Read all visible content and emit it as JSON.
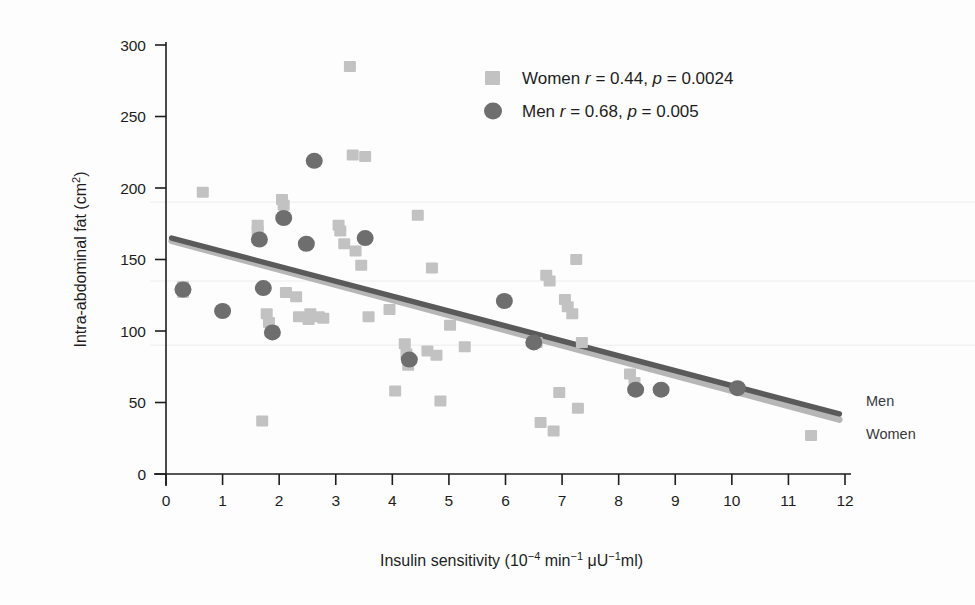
{
  "chart_data": {
    "type": "scatter",
    "title": "",
    "xlabel": "Insulin sensitivity (10−4 min−1 μU−1ml)",
    "ylabel": "Intra-abdominal fat (cm2)",
    "xlim": [
      0,
      12
    ],
    "ylim": [
      0,
      300
    ],
    "xticks": [
      "0",
      "1",
      "2",
      "3",
      "4",
      "5",
      "6",
      "7",
      "8",
      "9",
      "10",
      "11",
      "12"
    ],
    "xtick_values": [
      0,
      1,
      2,
      3,
      4,
      5,
      6,
      7,
      8,
      9,
      10,
      11,
      12
    ],
    "yticks": [
      "0",
      "50",
      "100",
      "150",
      "200",
      "250",
      "300"
    ],
    "ytick_values": [
      0,
      50,
      100,
      150,
      200,
      250,
      300
    ],
    "grid": "faint horizontal only",
    "legend_position": "top-right inside",
    "series": [
      {
        "name": "Women",
        "marker": "square",
        "color": "#c2c2c2",
        "r": 0.44,
        "p": 0.0024,
        "legend_label": "Women r = 0.44, p = 0.0024",
        "line_label": "Women",
        "points": [
          [
            0.3,
            131
          ],
          [
            0.3,
            127
          ],
          [
            0.65,
            197
          ],
          [
            1.62,
            174
          ],
          [
            1.62,
            170
          ],
          [
            1.7,
            37
          ],
          [
            1.78,
            112
          ],
          [
            1.82,
            106
          ],
          [
            1.88,
            100
          ],
          [
            2.05,
            192
          ],
          [
            2.08,
            188
          ],
          [
            2.12,
            127
          ],
          [
            2.3,
            124
          ],
          [
            2.35,
            110
          ],
          [
            2.52,
            108
          ],
          [
            2.55,
            112
          ],
          [
            2.7,
            110
          ],
          [
            2.78,
            109
          ],
          [
            3.05,
            174
          ],
          [
            3.08,
            170
          ],
          [
            3.15,
            161
          ],
          [
            3.25,
            285
          ],
          [
            3.3,
            223
          ],
          [
            3.35,
            156
          ],
          [
            3.45,
            146
          ],
          [
            3.52,
            222
          ],
          [
            3.58,
            110
          ],
          [
            3.95,
            115
          ],
          [
            4.05,
            58
          ],
          [
            4.22,
            91
          ],
          [
            4.25,
            84
          ],
          [
            4.28,
            76
          ],
          [
            4.45,
            181
          ],
          [
            4.62,
            86
          ],
          [
            4.7,
            144
          ],
          [
            4.78,
            83
          ],
          [
            4.85,
            51
          ],
          [
            5.02,
            104
          ],
          [
            5.28,
            89
          ],
          [
            6.55,
            92
          ],
          [
            6.62,
            36
          ],
          [
            6.72,
            139
          ],
          [
            6.78,
            135
          ],
          [
            6.85,
            30
          ],
          [
            6.95,
            57
          ],
          [
            7.05,
            122
          ],
          [
            7.1,
            117
          ],
          [
            7.18,
            112
          ],
          [
            7.25,
            150
          ],
          [
            7.28,
            46
          ],
          [
            7.35,
            92
          ],
          [
            8.2,
            70
          ],
          [
            8.28,
            64
          ],
          [
            11.4,
            27
          ]
        ],
        "trend_line": {
          "x1": 0.1,
          "y1": 163,
          "x2": 11.9,
          "y2": 38
        }
      },
      {
        "name": "Men",
        "marker": "circle",
        "color": "#6e6e6e",
        "r": 0.68,
        "p": 0.005,
        "legend_label": "Men r = 0.68, p = 0.005",
        "line_label": "Men",
        "points": [
          [
            0.3,
            129
          ],
          [
            1.0,
            114
          ],
          [
            1.65,
            164
          ],
          [
            1.72,
            130
          ],
          [
            1.88,
            99
          ],
          [
            2.08,
            179
          ],
          [
            2.48,
            161
          ],
          [
            2.62,
            219
          ],
          [
            3.52,
            165
          ],
          [
            4.3,
            80
          ],
          [
            5.98,
            121
          ],
          [
            6.5,
            92
          ],
          [
            8.3,
            59
          ],
          [
            8.75,
            59
          ],
          [
            10.1,
            60
          ]
        ],
        "trend_line": {
          "x1": 0.1,
          "y1": 165,
          "x2": 11.9,
          "y2": 42
        }
      }
    ],
    "legend": [
      {
        "label_prefix": "Women",
        "r_text": "r",
        "r_value": " = 0.44,",
        "p_text": "p",
        "p_value": " = 0.0024",
        "marker": "square",
        "color": "#c2c2c2"
      },
      {
        "label_prefix": "Men",
        "r_text": "r",
        "r_value": " = 0.68,",
        "p_text": "p",
        "p_value": " = 0.005",
        "marker": "circle",
        "color": "#6e6e6e"
      }
    ],
    "right_labels": [
      "Men",
      "Women"
    ],
    "colors": {
      "women_marker": "#c2c2c2",
      "men_marker": "#6e6e6e",
      "women_line": "#b6b6b6",
      "men_line": "#5a5a5a",
      "axis": "#1d1d1d",
      "grid": "#f2f2f2",
      "background": "#fdfdfd"
    }
  }
}
